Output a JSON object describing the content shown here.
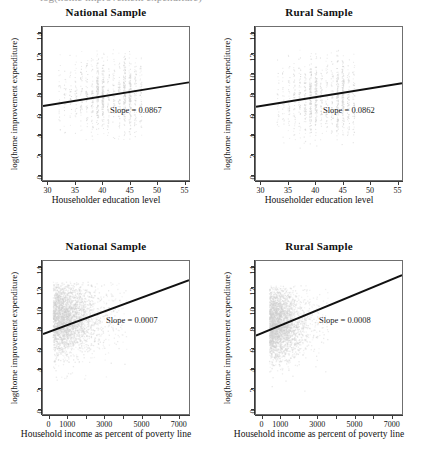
{
  "figure": {
    "cut_caption": "log(home improvement expenditure)",
    "background": "#ffffff",
    "point_color": "#cfcfcf",
    "line_color": "#111111",
    "axis_color": "#3a3a3a"
  },
  "chart_data": [
    {
      "type": "scatter",
      "title": "National Sample",
      "xlabel": "Householder education level",
      "ylabel": "log(home improvement expenditure)",
      "xlim": [
        29,
        56
      ],
      "ylim": [
        -0.6,
        14.6
      ],
      "xticks": [
        30,
        35,
        40,
        45,
        50,
        55
      ],
      "yticks": [
        0,
        2,
        4,
        6,
        8,
        10,
        12,
        14
      ],
      "grid": false,
      "annotation": "Slope = 0.0867",
      "slope": 0.0867,
      "intercept": 4.25,
      "fit_endpoints": [
        [
          29,
          6.76
        ],
        [
          56,
          9.1
        ]
      ],
      "cloud": {
        "shape": "vertical-stripes",
        "x_values": [
          32,
          33,
          34,
          35,
          36,
          37,
          38,
          39,
          40,
          41,
          42,
          43,
          44,
          45,
          46,
          47
        ],
        "y_range": [
          3.4,
          12.6
        ],
        "densest_x": [
          39,
          40,
          44,
          45
        ],
        "color": "#cfcfcf"
      }
    },
    {
      "type": "scatter",
      "title": "Rural Sample",
      "xlabel": "Householder education level",
      "ylabel": "log(home improvement expenditure)",
      "xlim": [
        29,
        56
      ],
      "ylim": [
        -0.6,
        14.6
      ],
      "xticks": [
        30,
        35,
        40,
        45,
        50,
        55
      ],
      "yticks": [
        0,
        2,
        4,
        6,
        8,
        10,
        12,
        14
      ],
      "grid": false,
      "annotation": "Slope = 0.0862",
      "slope": 0.0862,
      "intercept": 4.18,
      "fit_endpoints": [
        [
          29,
          6.68
        ],
        [
          56,
          9.01
        ]
      ],
      "cloud": {
        "shape": "vertical-stripes",
        "x_values": [
          33,
          34,
          35,
          36,
          37,
          38,
          39,
          40,
          41,
          42,
          43,
          44,
          45,
          46,
          47
        ],
        "y_range": [
          2.6,
          12.6
        ],
        "densest_x": [
          39,
          40,
          44,
          45
        ],
        "color": "#cfcfcf"
      }
    },
    {
      "type": "scatter",
      "title": "National Sample",
      "xlabel": "Household income as percent of poverty line",
      "ylabel": "log(home improvement expenditure)",
      "xlim": [
        -350,
        7600
      ],
      "ylim": [
        -0.6,
        14.6
      ],
      "xticks": [
        0,
        1000,
        2000,
        3000,
        4000,
        5000,
        6000,
        7000
      ],
      "xticklabels": [
        "0",
        "1000",
        "",
        "3000",
        "",
        "5000",
        "",
        "7000"
      ],
      "yticks": [
        0,
        2,
        4,
        6,
        8,
        10,
        12,
        14
      ],
      "grid": false,
      "annotation": "Slope = 0.0007",
      "slope": 0.0007,
      "intercept": 7.6,
      "fit_endpoints": [
        [
          -350,
          7.35
        ],
        [
          7600,
          12.7
        ]
      ],
      "cloud": {
        "shape": "blob-left-skewed",
        "x_range": [
          0,
          4200
        ],
        "y_range": [
          1.4,
          12.6
        ],
        "dense_core_x": [
          100,
          1600
        ],
        "dense_core_y": [
          6.5,
          11.5
        ],
        "color": "#cfcfcf"
      }
    },
    {
      "type": "scatter",
      "title": "Rural Sample",
      "xlabel": "Household income as percent of poverty line",
      "ylabel": "log(home improvement expenditure)",
      "xlim": [
        -350,
        7600
      ],
      "ylim": [
        -0.6,
        14.6
      ],
      "xticks": [
        0,
        1000,
        2000,
        3000,
        4000,
        5000,
        6000,
        7000
      ],
      "xticklabels": [
        "0",
        "1000",
        "",
        "3000",
        "",
        "5000",
        "",
        "7000"
      ],
      "yticks": [
        0,
        2,
        4,
        6,
        8,
        10,
        12,
        14
      ],
      "grid": false,
      "annotation": "Slope = 0.0008",
      "slope": 0.0008,
      "intercept": 7.45,
      "fit_endpoints": [
        [
          -350,
          7.18
        ],
        [
          7600,
          13.2
        ]
      ],
      "cloud": {
        "shape": "blob-left-skewed",
        "x_range": [
          150,
          3600
        ],
        "y_range": [
          1.6,
          12.2
        ],
        "dense_core_x": [
          300,
          1400
        ],
        "dense_core_y": [
          6.0,
          11.0
        ],
        "color": "#cfcfcf"
      }
    }
  ]
}
